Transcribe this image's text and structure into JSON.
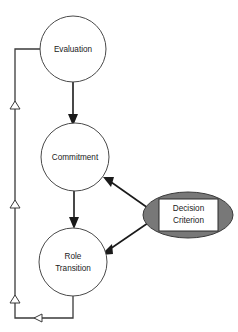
{
  "diagram": {
    "background_color": "#ffffff",
    "nodes": [
      {
        "id": "evaluation",
        "label": "Evaluation",
        "shape": "circle",
        "cx": 73,
        "cy": 49,
        "r": 33,
        "fill": "#ffffff",
        "stroke": "#4a4a4a"
      },
      {
        "id": "commitment",
        "label": "Commitment",
        "shape": "circle",
        "cx": 75,
        "cy": 157,
        "r": 34,
        "fill": "#ffffff",
        "stroke": "#4a4a4a"
      },
      {
        "id": "role-transition",
        "label_line1": "Role",
        "label_line2": "Transition",
        "shape": "circle",
        "cx": 73,
        "cy": 262,
        "r": 34,
        "fill": "#ffffff",
        "stroke": "#4a4a4a"
      },
      {
        "id": "decision-criterion",
        "label_line1": "Decision",
        "label_line2": "Criterion",
        "shape": "ellipse",
        "cx": 188,
        "cy": 215,
        "rx": 45,
        "ry": 23,
        "fill": "#787878",
        "stroke": "#3a3a3a",
        "inner_box_fill": "#ffffff",
        "inner_box_stroke": "#2b2b2b"
      }
    ],
    "edges": [
      {
        "id": "evaluation-to-commitment",
        "from": "evaluation",
        "to": "commitment",
        "style": "solid",
        "arrowhead": "filled"
      },
      {
        "id": "commitment-to-role-transition",
        "from": "commitment",
        "to": "role-transition",
        "style": "solid",
        "arrowhead": "filled"
      },
      {
        "id": "decision-to-commitment",
        "from": "decision-criterion",
        "to": "commitment",
        "style": "solid",
        "arrowhead": "filled"
      },
      {
        "id": "decision-to-role-transition",
        "from": "decision-criterion",
        "to": "role-transition",
        "style": "solid",
        "arrowhead": "filled"
      },
      {
        "id": "role-transition-to-evaluation-feedback",
        "from": "role-transition",
        "to": "evaluation",
        "style": "feedback-loop",
        "arrowhead": "filled",
        "midpoint_markers": "hollow-triangle",
        "marker_count": 4
      }
    ]
  }
}
